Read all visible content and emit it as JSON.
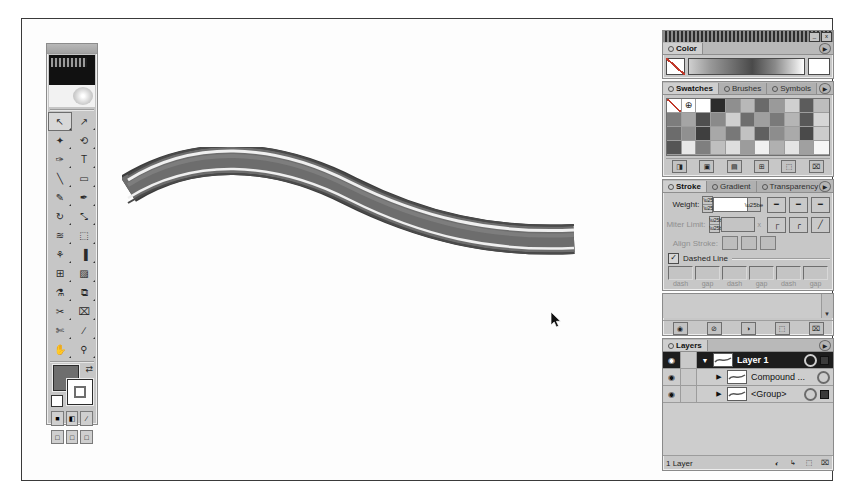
{
  "window": {
    "title": "",
    "minimize_label": "_",
    "close_label": "x"
  },
  "toolbox": {
    "name": "Tools",
    "tools": [
      {
        "name": "selection-tool",
        "glyph": "↖",
        "selected": true
      },
      {
        "name": "direct-selection-tool",
        "glyph": "↗",
        "selected": false
      },
      {
        "name": "magic-wand-tool",
        "glyph": "✦",
        "selected": false
      },
      {
        "name": "lasso-tool",
        "glyph": "⟲",
        "selected": false
      },
      {
        "name": "pen-tool",
        "glyph": "✑",
        "selected": false
      },
      {
        "name": "type-tool",
        "glyph": "T",
        "selected": false
      },
      {
        "name": "line-segment-tool",
        "glyph": "╲",
        "selected": false
      },
      {
        "name": "rectangle-tool",
        "glyph": "▭",
        "selected": false
      },
      {
        "name": "paintbrush-tool",
        "glyph": "✎",
        "selected": false
      },
      {
        "name": "pencil-tool",
        "glyph": "✒",
        "selected": false
      },
      {
        "name": "rotate-tool",
        "glyph": "↻",
        "selected": false
      },
      {
        "name": "scale-tool",
        "glyph": "⤡",
        "selected": false
      },
      {
        "name": "warp-tool",
        "glyph": "≋",
        "selected": false
      },
      {
        "name": "free-transform-tool",
        "glyph": "⬚",
        "selected": false
      },
      {
        "name": "symbol-sprayer-tool",
        "glyph": "⚘",
        "selected": false
      },
      {
        "name": "column-graph-tool",
        "glyph": "▐",
        "selected": false
      },
      {
        "name": "mesh-tool",
        "glyph": "⊞",
        "selected": false
      },
      {
        "name": "gradient-tool",
        "glyph": "▨",
        "selected": false
      },
      {
        "name": "eyedropper-tool",
        "glyph": "⚗",
        "selected": false
      },
      {
        "name": "blend-tool",
        "glyph": "⧉",
        "selected": false
      },
      {
        "name": "slice-tool",
        "glyph": "✂",
        "selected": false
      },
      {
        "name": "erase-tool",
        "glyph": "⌧",
        "selected": false
      },
      {
        "name": "scissors-tool",
        "glyph": "✄",
        "selected": false
      },
      {
        "name": "knife-tool",
        "glyph": "∕",
        "selected": false
      },
      {
        "name": "hand-tool",
        "glyph": "✋",
        "selected": false
      },
      {
        "name": "zoom-tool",
        "glyph": "⚲",
        "selected": false
      }
    ],
    "fill_color": "#6e6e6e",
    "stroke_color": "#ffffff",
    "swap_glyph": "⇄",
    "paint_modes": [
      {
        "name": "color-mode-button",
        "glyph": "■"
      },
      {
        "name": "gradient-mode-button",
        "glyph": "◧"
      },
      {
        "name": "none-mode-button",
        "glyph": "∕"
      }
    ],
    "screen_modes": [
      {
        "name": "standard-screen-mode-button",
        "glyph": "□"
      },
      {
        "name": "full-screen-menubar-mode-button",
        "glyph": "□"
      },
      {
        "name": "full-screen-mode-button",
        "glyph": "□"
      }
    ]
  },
  "color_palette": {
    "tabs": [
      {
        "label": "Color",
        "active": true
      }
    ],
    "none_swatch": "none-swatch",
    "ramp": "grayscale-ramp",
    "white_chip": "#ffffff",
    "menu_glyph": "▶"
  },
  "swatches_palette": {
    "tabs": [
      {
        "label": "Swatches",
        "active": true
      },
      {
        "label": "Brushes",
        "active": false
      },
      {
        "label": "Symbols",
        "active": false
      }
    ],
    "menu_glyph": "▶",
    "rows": [
      [
        "#ffffff",
        "#ffffff",
        "#ffffff",
        "#2b2b2b",
        "#8f8f8f",
        "#b8b8b8",
        "#6a6a6a",
        "#9a9a9a",
        "#d0d0d0",
        "#5c5c5c",
        "#bdbdbd"
      ],
      [
        "#7d7d7d",
        "#a5a5a5",
        "#4f4f4f",
        "#8a8a8a",
        "#cfcfcf",
        "#6e6e6e",
        "#9f9f9f",
        "#7a7a7a",
        "#b5b5b5",
        "#585858",
        "#d6d6d6"
      ],
      [
        "#6c6c6c",
        "#909090",
        "#3f3f3f",
        "#a8a8a8",
        "#787878",
        "#c2c2c2",
        "#606060",
        "#8d8d8d",
        "#aaaaaa",
        "#4a4a4a",
        "#cccccc"
      ],
      [
        "#555555",
        "#e8e8e8",
        "#7f7f7f",
        "#bfbfbf",
        "#dedede",
        "#9c9c9c",
        "#f0f0f0",
        "#b0b0b0",
        "#e4e4e4",
        "#a0a0a0",
        "#f6f6f6"
      ]
    ],
    "footer_icons": [
      {
        "name": "swatch-library-button",
        "glyph": "◨"
      },
      {
        "name": "show-swatch-kinds-button",
        "glyph": "▣"
      },
      {
        "name": "swatch-options-button",
        "glyph": "▤"
      },
      {
        "name": "new-color-group-button",
        "glyph": "⊞"
      },
      {
        "name": "new-swatch-button",
        "glyph": "⬚"
      },
      {
        "name": "delete-swatch-button",
        "glyph": "⌧"
      }
    ]
  },
  "stroke_palette": {
    "tabs": [
      {
        "label": "Stroke",
        "active": true
      },
      {
        "label": "Gradient",
        "active": false
      },
      {
        "label": "Transparency",
        "active": false
      }
    ],
    "menu_glyph": "▶",
    "weight_label": "Weight:",
    "weight_value": "",
    "miter_label": "Miter Limit:",
    "miter_value": "",
    "miter_suffix": "x",
    "align_label": "Align Stroke:",
    "caps": [
      {
        "name": "butt-cap-button",
        "glyph": "━"
      },
      {
        "name": "round-cap-button",
        "glyph": "━"
      },
      {
        "name": "projecting-cap-button",
        "glyph": "━"
      }
    ],
    "joins": [
      {
        "name": "miter-join-button",
        "glyph": "┌"
      },
      {
        "name": "round-join-button",
        "glyph": "╭"
      },
      {
        "name": "bevel-join-button",
        "glyph": "╱"
      }
    ],
    "align_buttons": [
      {
        "name": "align-stroke-center-button"
      },
      {
        "name": "align-stroke-inside-button"
      },
      {
        "name": "align-stroke-outside-button"
      }
    ],
    "dashed_line_label": "Dashed Line",
    "dashed_line_checked": true,
    "dash_check_glyph": "✓",
    "dash_fields": [
      {
        "label": "dash",
        "value": ""
      },
      {
        "label": "gap",
        "value": ""
      },
      {
        "label": "dash",
        "value": ""
      },
      {
        "label": "gap",
        "value": ""
      },
      {
        "label": "dash",
        "value": ""
      },
      {
        "label": "gap",
        "value": ""
      }
    ]
  },
  "brushes_palette": {
    "footer_icons": [
      {
        "name": "brush-libraries-button",
        "glyph": "◉"
      },
      {
        "name": "remove-brush-stroke-button",
        "glyph": "⊘"
      },
      {
        "name": "options-of-selected-object-button",
        "glyph": "◑"
      },
      {
        "name": "new-brush-button",
        "glyph": "⬚"
      },
      {
        "name": "delete-brush-button",
        "glyph": "⌧"
      }
    ],
    "scroll_glyph": "▼"
  },
  "layers_palette": {
    "tabs": [
      {
        "label": "Layers",
        "active": true
      }
    ],
    "menu_glyph": "▶",
    "eye_glyph": "◉",
    "expand_glyph": "▼",
    "collapse_glyph": "▶",
    "rows": [
      {
        "name": "Layer 1",
        "selected": true,
        "expanded": true,
        "indent": 0,
        "has_selected_square": false
      },
      {
        "name": "Compound ...",
        "selected": false,
        "expanded": false,
        "indent": 1,
        "has_selected_square": false
      },
      {
        "name": "<Group>",
        "selected": false,
        "expanded": false,
        "indent": 1,
        "has_selected_square": true
      }
    ],
    "status_text": "1 Layer",
    "status_icons": [
      {
        "name": "make-clipping-mask-button",
        "glyph": "◐"
      },
      {
        "name": "create-new-sublayer-button",
        "glyph": "↳"
      },
      {
        "name": "create-new-layer-button",
        "glyph": "⬚"
      },
      {
        "name": "delete-selection-button",
        "glyph": "⌧"
      }
    ]
  },
  "artwork": {
    "name": "dashed-stroke-ribbon-path",
    "description": "S-curved striped ribbon artwork",
    "band_color": "#6b6b6b",
    "edge_color": "#3c3c3c",
    "highlight_color": "#efefef"
  },
  "cursor": {
    "name": "mouse-pointer",
    "x": 528,
    "y": 292
  }
}
